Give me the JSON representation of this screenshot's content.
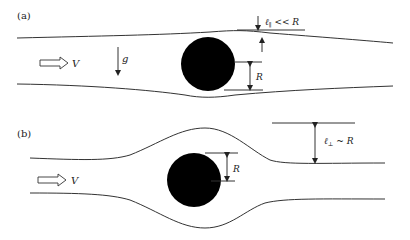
{
  "panels": {
    "a": {
      "label": "(a)",
      "velocity_label": "V",
      "gravity_label": "g",
      "radius_label": "R",
      "thickness_label_sym": "ℓ",
      "thickness_label_sub": "∥",
      "thickness_label_rel": " << R"
    },
    "b": {
      "label": "(b)",
      "velocity_label": "V",
      "radius_label": "R",
      "thickness_label_sym": "ℓ",
      "thickness_label_sub": "⊥",
      "thickness_label_rel": " ~ R"
    }
  },
  "colors": {
    "ink": "#222222",
    "sphere": "#000000",
    "background": "#ffffff"
  }
}
